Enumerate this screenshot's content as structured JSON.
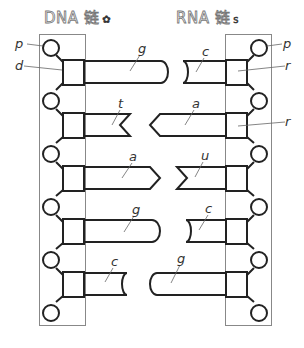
{
  "titles": {
    "dna": {
      "label": "DNA 链",
      "mark": "✿"
    },
    "rna": {
      "label": "RNA 链",
      "mark": "s"
    }
  },
  "labels": {
    "phosphate": "p",
    "deoxyribose": "d",
    "ribose": "r"
  },
  "dna_bases": [
    "g",
    "t",
    "a",
    "g",
    "c"
  ],
  "rna_bases": [
    "c",
    "a",
    "u",
    "c",
    "g"
  ]
}
